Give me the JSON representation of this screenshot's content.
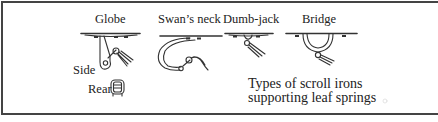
{
  "figure": {
    "caption_line1": "Types of scroll irons",
    "caption_line2": "supporting leaf springs",
    "items": [
      {
        "label": "Globe"
      },
      {
        "label": "Swan’s neck"
      },
      {
        "label": "Dumb-jack"
      },
      {
        "label": "Bridge"
      }
    ],
    "globe_views": {
      "side": "Side",
      "rear": "Rear"
    }
  }
}
